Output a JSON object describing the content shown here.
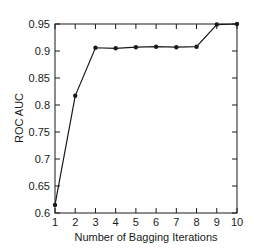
{
  "chart_data": {
    "type": "line",
    "title": "",
    "xlabel": "Number of Bagging Iterations",
    "ylabel": "ROC AUC",
    "x": [
      1,
      2,
      3,
      4,
      5,
      6,
      7,
      8,
      9,
      10
    ],
    "series": [
      {
        "name": "ROC AUC",
        "values": [
          0.615,
          0.817,
          0.906,
          0.905,
          0.907,
          0.908,
          0.907,
          0.908,
          0.949,
          0.95
        ],
        "marker": "circle",
        "color": "#1a1a1a"
      }
    ],
    "xlim": [
      1,
      10
    ],
    "ylim": [
      0.6,
      0.95
    ],
    "xticks": [
      "1",
      "2",
      "3",
      "4",
      "5",
      "6",
      "7",
      "8",
      "9",
      "10"
    ],
    "yticks": [
      "0.6",
      "0.65",
      "0.7",
      "0.75",
      "0.8",
      "0.85",
      "0.9",
      "0.95"
    ],
    "grid": false,
    "legend": false
  }
}
